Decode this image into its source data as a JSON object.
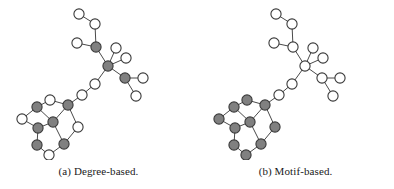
{
  "figure": {
    "background_color": "#ffffff",
    "node_fill_highlight": "#808080",
    "node_fill_plain": "#ffffff",
    "node_stroke_color": "#3a3a3a",
    "edge_color": "#4a4a4a",
    "node_radius": 5.1,
    "node_stroke_width": 1.1,
    "edge_width": 1.0
  },
  "panels": [
    {
      "id": "degree-based",
      "caption": "(a) Degree-based.",
      "chart_data": {
        "type": "graph",
        "title": "(a) Degree-based.",
        "coloring_scheme": "degree",
        "legend": [],
        "nodes": [
          {
            "id": "n0",
            "x": 79,
            "y": 14,
            "fill": "plain",
            "group": "chain-top"
          },
          {
            "id": "n1",
            "x": 95,
            "y": 24,
            "fill": "plain",
            "group": "chain-top"
          },
          {
            "id": "n2",
            "x": 96,
            "y": 47,
            "fill": "highlight",
            "group": "branch-upper"
          },
          {
            "id": "n3",
            "x": 77,
            "y": 43,
            "fill": "plain",
            "group": "branch-upper"
          },
          {
            "id": "n4",
            "x": 108,
            "y": 66,
            "fill": "highlight",
            "group": "hub"
          },
          {
            "id": "n5",
            "x": 116,
            "y": 48,
            "fill": "plain",
            "group": "hub-leaf"
          },
          {
            "id": "n6",
            "x": 126,
            "y": 58,
            "fill": "plain",
            "group": "hub-leaf"
          },
          {
            "id": "n7",
            "x": 125,
            "y": 78,
            "fill": "highlight",
            "group": "branch-lower"
          },
          {
            "id": "n8",
            "x": 143,
            "y": 78,
            "fill": "plain",
            "group": "branch-lower-leaf"
          },
          {
            "id": "n9",
            "x": 136,
            "y": 96,
            "fill": "plain",
            "group": "branch-lower-leaf"
          },
          {
            "id": "n10",
            "x": 95,
            "y": 84,
            "fill": "plain",
            "group": "linker"
          },
          {
            "id": "n11",
            "x": 82,
            "y": 95,
            "fill": "plain",
            "group": "linker"
          },
          {
            "id": "n12",
            "x": 68,
            "y": 105,
            "fill": "highlight",
            "group": "ring"
          },
          {
            "id": "n13",
            "x": 50,
            "y": 100,
            "fill": "plain",
            "group": "ring"
          },
          {
            "id": "n14",
            "x": 37,
            "y": 107,
            "fill": "highlight",
            "group": "ring"
          },
          {
            "id": "n15",
            "x": 22,
            "y": 119,
            "fill": "plain",
            "group": "ring"
          },
          {
            "id": "n16",
            "x": 38,
            "y": 128,
            "fill": "highlight",
            "group": "ring"
          },
          {
            "id": "n17",
            "x": 53,
            "y": 122,
            "fill": "highlight",
            "group": "ring"
          },
          {
            "id": "n18",
            "x": 37,
            "y": 145,
            "fill": "highlight",
            "group": "ring"
          },
          {
            "id": "n19",
            "x": 49,
            "y": 155,
            "fill": "plain",
            "group": "ring"
          },
          {
            "id": "n20",
            "x": 64,
            "y": 144,
            "fill": "highlight",
            "group": "ring"
          },
          {
            "id": "n21",
            "x": 78,
            "y": 127,
            "fill": "plain",
            "group": "ring"
          }
        ],
        "edges": [
          [
            "n0",
            "n1"
          ],
          [
            "n1",
            "n2"
          ],
          [
            "n2",
            "n3"
          ],
          [
            "n2",
            "n4"
          ],
          [
            "n4",
            "n5"
          ],
          [
            "n4",
            "n6"
          ],
          [
            "n4",
            "n7"
          ],
          [
            "n7",
            "n8"
          ],
          [
            "n7",
            "n9"
          ],
          [
            "n4",
            "n10"
          ],
          [
            "n10",
            "n11"
          ],
          [
            "n11",
            "n12"
          ],
          [
            "n12",
            "n13"
          ],
          [
            "n13",
            "n14"
          ],
          [
            "n14",
            "n15"
          ],
          [
            "n15",
            "n16"
          ],
          [
            "n16",
            "n17"
          ],
          [
            "n17",
            "n12"
          ],
          [
            "n14",
            "n17"
          ],
          [
            "n16",
            "n18"
          ],
          [
            "n18",
            "n19"
          ],
          [
            "n19",
            "n20"
          ],
          [
            "n20",
            "n17"
          ],
          [
            "n20",
            "n21"
          ],
          [
            "n21",
            "n12"
          ]
        ]
      }
    },
    {
      "id": "motif-based",
      "caption": "(b) Motif-based.",
      "chart_data": {
        "type": "graph",
        "title": "(b) Motif-based.",
        "coloring_scheme": "motif",
        "legend": [],
        "nodes": [
          {
            "id": "m0",
            "x": 79,
            "y": 14,
            "fill": "plain",
            "group": "chain-top"
          },
          {
            "id": "m1",
            "x": 95,
            "y": 24,
            "fill": "plain",
            "group": "chain-top"
          },
          {
            "id": "m2",
            "x": 96,
            "y": 47,
            "fill": "plain",
            "group": "branch-upper"
          },
          {
            "id": "m3",
            "x": 77,
            "y": 43,
            "fill": "plain",
            "group": "branch-upper"
          },
          {
            "id": "m4",
            "x": 108,
            "y": 66,
            "fill": "plain",
            "group": "hub"
          },
          {
            "id": "m5",
            "x": 116,
            "y": 48,
            "fill": "plain",
            "group": "hub-leaf"
          },
          {
            "id": "m6",
            "x": 126,
            "y": 58,
            "fill": "plain",
            "group": "hub-leaf"
          },
          {
            "id": "m7",
            "x": 125,
            "y": 78,
            "fill": "plain",
            "group": "branch-lower"
          },
          {
            "id": "m8",
            "x": 143,
            "y": 78,
            "fill": "plain",
            "group": "branch-lower-leaf"
          },
          {
            "id": "m9",
            "x": 136,
            "y": 96,
            "fill": "plain",
            "group": "branch-lower-leaf"
          },
          {
            "id": "m10",
            "x": 95,
            "y": 84,
            "fill": "plain",
            "group": "linker"
          },
          {
            "id": "m11",
            "x": 82,
            "y": 95,
            "fill": "plain",
            "group": "linker"
          },
          {
            "id": "m12",
            "x": 68,
            "y": 105,
            "fill": "highlight",
            "group": "ring"
          },
          {
            "id": "m13",
            "x": 50,
            "y": 100,
            "fill": "highlight",
            "group": "ring"
          },
          {
            "id": "m14",
            "x": 37,
            "y": 107,
            "fill": "highlight",
            "group": "ring"
          },
          {
            "id": "m15",
            "x": 22,
            "y": 119,
            "fill": "highlight",
            "group": "ring"
          },
          {
            "id": "m16",
            "x": 38,
            "y": 128,
            "fill": "highlight",
            "group": "ring"
          },
          {
            "id": "m17",
            "x": 53,
            "y": 122,
            "fill": "highlight",
            "group": "ring"
          },
          {
            "id": "m18",
            "x": 37,
            "y": 145,
            "fill": "highlight",
            "group": "ring"
          },
          {
            "id": "m19",
            "x": 49,
            "y": 155,
            "fill": "highlight",
            "group": "ring"
          },
          {
            "id": "m20",
            "x": 64,
            "y": 144,
            "fill": "highlight",
            "group": "ring"
          },
          {
            "id": "m21",
            "x": 78,
            "y": 127,
            "fill": "highlight",
            "group": "ring"
          }
        ],
        "edges": [
          [
            "m0",
            "m1"
          ],
          [
            "m1",
            "m2"
          ],
          [
            "m2",
            "m3"
          ],
          [
            "m2",
            "m4"
          ],
          [
            "m4",
            "m5"
          ],
          [
            "m4",
            "m6"
          ],
          [
            "m4",
            "m7"
          ],
          [
            "m7",
            "m8"
          ],
          [
            "m7",
            "m9"
          ],
          [
            "m4",
            "m10"
          ],
          [
            "m10",
            "m11"
          ],
          [
            "m11",
            "m12"
          ],
          [
            "m12",
            "m13"
          ],
          [
            "m13",
            "m14"
          ],
          [
            "m14",
            "m15"
          ],
          [
            "m15",
            "m16"
          ],
          [
            "m16",
            "m17"
          ],
          [
            "m17",
            "m12"
          ],
          [
            "m14",
            "m17"
          ],
          [
            "m16",
            "m18"
          ],
          [
            "m18",
            "m19"
          ],
          [
            "m19",
            "m20"
          ],
          [
            "m20",
            "m17"
          ],
          [
            "m20",
            "m21"
          ],
          [
            "m21",
            "m12"
          ]
        ]
      }
    }
  ]
}
